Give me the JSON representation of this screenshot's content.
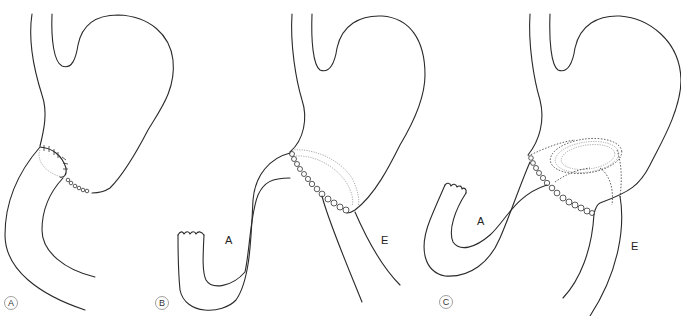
{
  "figure": {
    "panels": [
      {
        "id": "A",
        "label": "A",
        "annotations": []
      },
      {
        "id": "B",
        "label": "B",
        "annotations": [
          {
            "text": "A",
            "meaning": "afferent limb"
          },
          {
            "text": "E",
            "meaning": "efferent limb"
          }
        ]
      },
      {
        "id": "C",
        "label": "C",
        "annotations": [
          {
            "text": "A",
            "meaning": "afferent limb"
          },
          {
            "text": "E",
            "meaning": "efferent limb"
          }
        ]
      }
    ]
  },
  "labels": {
    "panel_a": "A",
    "panel_b": "B",
    "panel_c": "C",
    "b_afferent": "A",
    "b_efferent": "E",
    "c_afferent": "A",
    "c_efferent": "E"
  },
  "colors": {
    "line": "#2a2a2a",
    "suture_faint": "#8a8a8a",
    "background": "#ffffff"
  }
}
